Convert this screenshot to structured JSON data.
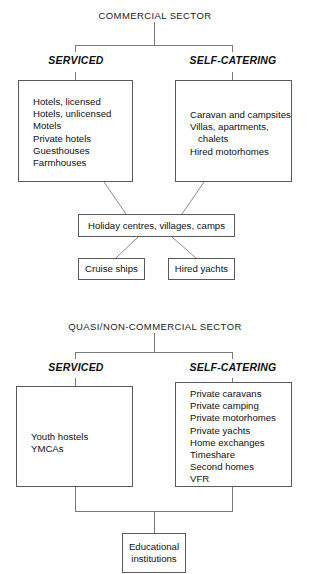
{
  "diagram": {
    "line_color": "#6b6b6b",
    "box_border_color": "#5a5a5a",
    "text_color": "#111111",
    "background": "#ffffff"
  },
  "commercial": {
    "sector_title": "COMMERCIAL SECTOR",
    "branches": [
      {
        "label": "SERVICED"
      },
      {
        "label": "SELF-CATERING"
      }
    ],
    "serviced_box": {
      "items": [
        "Hotels, licensed",
        "Hotels, unlicensed",
        "Motels",
        "Private hotels",
        "Guesthouses",
        "Farmhouses"
      ]
    },
    "self_catering_box": {
      "items": [
        "Caravan and campsites",
        "Villas, apartments,",
        "   chalets",
        "Hired motorhomes"
      ]
    },
    "holiday_centres": "Holiday centres, villages, camps",
    "cruise_ships": "Cruise ships",
    "hired_yachts": "Hired yachts"
  },
  "quasi": {
    "sector_title": "QUASI/NON-COMMERCIAL SECTOR",
    "branches": [
      {
        "label": "SERVICED"
      },
      {
        "label": "SELF-CATERING"
      }
    ],
    "serviced_box": {
      "items": [
        "Youth hostels",
        "YMCAs"
      ]
    },
    "self_catering_box": {
      "items": [
        "Private caravans",
        "Private camping",
        "Private motorhomes",
        "Private yachts",
        "Home exchanges",
        "Timeshare",
        "Second homes",
        "VFR"
      ]
    },
    "educational_institutions_line1": "Educational",
    "educational_institutions_line2": "institutions"
  }
}
